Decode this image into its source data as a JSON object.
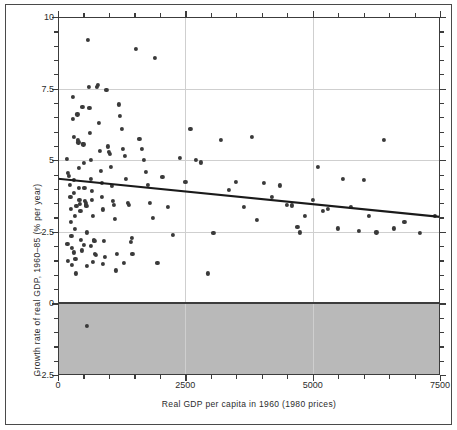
{
  "figure": {
    "background": "#ffffff",
    "frame_color": "#4a4a4a",
    "shade_color": "#b9b9b9",
    "point_color": "#3a3a3a",
    "line_color": "#1a1a1a",
    "grid_color": "#cfcfcf"
  },
  "chart_data": {
    "type": "scatter",
    "title": "",
    "xlabel": "Real GDP per capita in 1960 (1980 prices)",
    "ylabel": "Growth rate of real GDP, 1960–85 (% per year)",
    "xlim": [
      0,
      7500
    ],
    "ylim": [
      -2.5,
      10
    ],
    "xticks": [
      0,
      2500,
      5000,
      7500
    ],
    "xticklabels": [
      "0",
      "2500",
      "5000",
      "7500"
    ],
    "yticks": [
      -2.5,
      0,
      2.5,
      5,
      7.5,
      10
    ],
    "yticklabels": [
      "−2.5",
      "0",
      "2.5",
      "5",
      "7.5",
      "10"
    ],
    "x_minor_step": 500,
    "y_minor_step": 0.5,
    "grid": true,
    "grid_axis": "both",
    "legend": null,
    "shaded_region": {
      "label": "negative growth region",
      "y_from": -2.5,
      "y_to": 0,
      "color": "#b9b9b9"
    },
    "trendline": {
      "label": "fitted regression line",
      "x": [
        0,
        7500
      ],
      "y": [
        4.35,
        3.02
      ]
    },
    "points": [
      [
        170,
        5.05
      ],
      [
        200,
        4.55
      ],
      [
        215,
        4.45
      ],
      [
        230,
        4.15
      ],
      [
        245,
        3.72
      ],
      [
        250,
        3.3
      ],
      [
        255,
        2.85
      ],
      [
        262,
        2.35
      ],
      [
        268,
        1.95
      ],
      [
        275,
        1.35
      ],
      [
        290,
        6.45
      ],
      [
        300,
        7.2
      ],
      [
        305,
        5.8
      ],
      [
        312,
        4.3
      ],
      [
        318,
        3.85
      ],
      [
        325,
        3.05
      ],
      [
        330,
        2.6
      ],
      [
        340,
        1.55
      ],
      [
        350,
        1.05
      ],
      [
        360,
        3.4
      ],
      [
        380,
        6.6
      ],
      [
        395,
        5.7
      ],
      [
        400,
        5.62
      ],
      [
        410,
        4.72
      ],
      [
        415,
        4.02
      ],
      [
        420,
        3.62
      ],
      [
        430,
        3.48
      ],
      [
        440,
        3.22
      ],
      [
        455,
        2.22
      ],
      [
        465,
        1.85
      ],
      [
        480,
        6.85
      ],
      [
        495,
        5.58
      ],
      [
        500,
        5.55
      ],
      [
        510,
        4.9
      ],
      [
        520,
        4.02
      ],
      [
        530,
        3.58
      ],
      [
        540,
        3.52
      ],
      [
        548,
        3.45
      ],
      [
        556,
        3.4
      ],
      [
        566,
        2.48
      ],
      [
        575,
        1.3
      ],
      [
        590,
        9.2
      ],
      [
        600,
        7.55
      ],
      [
        615,
        6.82
      ],
      [
        625,
        5.95
      ],
      [
        640,
        5.0
      ],
      [
        650,
        4.35
      ],
      [
        660,
        3.92
      ],
      [
        672,
        3.62
      ],
      [
        684,
        3.05
      ],
      [
        700,
        2.22
      ],
      [
        715,
        2.18
      ],
      [
        730,
        1.72
      ],
      [
        745,
        1.68
      ],
      [
        560,
        -0.78
      ],
      [
        760,
        7.55
      ],
      [
        780,
        7.62
      ],
      [
        800,
        6.3
      ],
      [
        820,
        5.32
      ],
      [
        840,
        4.62
      ],
      [
        855,
        4.2
      ],
      [
        870,
        3.72
      ],
      [
        885,
        3.28
      ],
      [
        900,
        2.18
      ],
      [
        920,
        1.62
      ],
      [
        950,
        7.45
      ],
      [
        980,
        5.48
      ],
      [
        1000,
        5.28
      ],
      [
        1020,
        5.22
      ],
      [
        1040,
        4.78
      ],
      [
        1060,
        4.1
      ],
      [
        1080,
        3.58
      ],
      [
        1100,
        3.45
      ],
      [
        1120,
        2.95
      ],
      [
        1150,
        1.72
      ],
      [
        1190,
        6.95
      ],
      [
        1220,
        6.55
      ],
      [
        1250,
        6.1
      ],
      [
        1280,
        5.4
      ],
      [
        1310,
        5.15
      ],
      [
        1340,
        4.35
      ],
      [
        1370,
        3.52
      ],
      [
        1400,
        3.45
      ],
      [
        1430,
        2.15
      ],
      [
        1460,
        1.72
      ],
      [
        1530,
        8.88
      ],
      [
        1600,
        5.75
      ],
      [
        1640,
        5.4
      ],
      [
        1680,
        5.02
      ],
      [
        1720,
        4.6
      ],
      [
        1760,
        4.15
      ],
      [
        1800,
        3.5
      ],
      [
        1860,
        2.98
      ],
      [
        1900,
        8.58
      ],
      [
        1950,
        1.42
      ],
      [
        2050,
        4.42
      ],
      [
        2150,
        3.38
      ],
      [
        2250,
        2.38
      ],
      [
        2400,
        5.08
      ],
      [
        2500,
        4.25
      ],
      [
        2600,
        6.1
      ],
      [
        2700,
        5.02
      ],
      [
        2800,
        4.92
      ],
      [
        2950,
        1.05
      ],
      [
        3050,
        2.45
      ],
      [
        3200,
        5.72
      ],
      [
        3350,
        3.95
      ],
      [
        3500,
        4.25
      ],
      [
        3650,
        3.38
      ],
      [
        3800,
        5.82
      ],
      [
        3900,
        2.92
      ],
      [
        4050,
        4.22
      ],
      [
        4200,
        3.72
      ],
      [
        4350,
        4.12
      ],
      [
        4500,
        3.45
      ],
      [
        4600,
        3.42
      ],
      [
        4700,
        2.68
      ],
      [
        4750,
        2.48
      ],
      [
        4850,
        3.05
      ],
      [
        5000,
        3.62
      ],
      [
        5100,
        4.78
      ],
      [
        5200,
        3.22
      ],
      [
        5300,
        3.3
      ],
      [
        5500,
        2.62
      ],
      [
        5600,
        4.35
      ],
      [
        5750,
        3.38
      ],
      [
        5900,
        2.52
      ],
      [
        6000,
        4.32
      ],
      [
        6100,
        3.05
      ],
      [
        6250,
        2.48
      ],
      [
        6400,
        5.7
      ],
      [
        6600,
        2.62
      ],
      [
        6800,
        2.85
      ],
      [
        7100,
        2.45
      ],
      [
        7400,
        3.05
      ],
      [
        185,
        2.08
      ],
      [
        195,
        1.48
      ],
      [
        320,
        1.78
      ],
      [
        505,
        2.05
      ],
      [
        640,
        2.02
      ],
      [
        690,
        1.45
      ],
      [
        880,
        1.38
      ],
      [
        1130,
        1.15
      ],
      [
        1300,
        1.42
      ],
      [
        1450,
        2.28
      ]
    ]
  }
}
